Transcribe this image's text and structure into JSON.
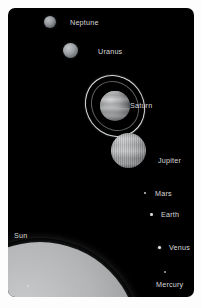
{
  "figure": {
    "background_color": "#010101",
    "label_color": "#d9d9d9"
  },
  "bodies": [
    {
      "name": "Neptune",
      "label": "Neptune",
      "label_x": 62,
      "label_y": 11,
      "kind": "ice-giant"
    },
    {
      "name": "Uranus",
      "label": "Uranus",
      "label_x": 90,
      "label_y": 40,
      "kind": "ice-giant"
    },
    {
      "name": "Saturn",
      "label": "Saturn",
      "label_x": 122,
      "label_y": 94,
      "kind": "ringed-gas-giant"
    },
    {
      "name": "Jupiter",
      "label": "Jupiter",
      "label_x": 150,
      "label_y": 149,
      "kind": "gas-giant"
    },
    {
      "name": "Mars",
      "label": "Mars",
      "label_x": 147,
      "label_y": 182,
      "kind": "terrestrial"
    },
    {
      "name": "Earth",
      "label": "Earth",
      "label_x": 153,
      "label_y": 203,
      "kind": "terrestrial"
    },
    {
      "name": "Venus",
      "label": "Venus",
      "label_x": 161,
      "label_y": 236,
      "kind": "terrestrial"
    },
    {
      "name": "Mercury",
      "label": "Mercury",
      "label_x": 148,
      "label_y": 273,
      "kind": "terrestrial"
    },
    {
      "name": "Sun",
      "label": "Sun",
      "label_x": 6,
      "label_y": 224,
      "kind": "star"
    }
  ]
}
